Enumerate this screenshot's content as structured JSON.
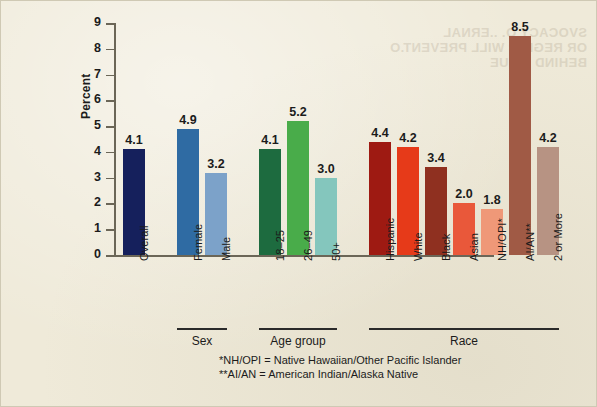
{
  "background_bleed_text": [
    "SVOCACY O. ..ERNAL",
    "OR REGIS = WILL PREVENT.O",
    "BEHIND ISSUE"
  ],
  "chart_data": {
    "type": "bar",
    "title": "",
    "xlabel": "",
    "ylabel": "Percent",
    "ylim": [
      0,
      9
    ],
    "yticks": [
      0,
      1,
      2,
      3,
      4,
      5,
      6,
      7,
      8,
      9
    ],
    "ytick_labels": [
      "0",
      "1",
      "2",
      "3",
      "4",
      "5",
      "6",
      "7",
      "8",
      "9"
    ],
    "grid": false,
    "legend": "none",
    "categories": [
      "Overall",
      "Female",
      "Male",
      "18–25",
      "26–49",
      "50+",
      "Hispanic",
      "White",
      "Black",
      "Asian",
      "NH/OPI*",
      "AI/AN**",
      "2 or More"
    ],
    "values": [
      4.1,
      4.9,
      3.2,
      4.1,
      5.2,
      3.0,
      4.4,
      4.2,
      3.4,
      2.0,
      1.8,
      8.5,
      4.2
    ],
    "value_labels": [
      "4.1",
      "4.9",
      "3.2",
      "4.1",
      "5.2",
      "3.0",
      "4.4",
      "4.2",
      "3.4",
      "2.0",
      "1.8",
      "8.5",
      "4.2"
    ],
    "colors": [
      "#15205c",
      "#2f6ba3",
      "#7ca2c9",
      "#1d6b3f",
      "#49ac4a",
      "#84c6bd",
      "#9e1a12",
      "#e63a19",
      "#8f3020",
      "#e9583a",
      "#ef9878",
      "#a05a45",
      "#b79383"
    ],
    "groups": [
      {
        "label": "Sex",
        "start_index": 1,
        "end_index": 2
      },
      {
        "label": "Age group",
        "start_index": 3,
        "end_index": 5
      },
      {
        "label": "Race",
        "start_index": 6,
        "end_index": 12
      }
    ],
    "footnotes": [
      "*NH/OPI = Native Hawaiian/Other Pacific Islander",
      "**AI/AN = American Indian/Alaska Native"
    ]
  }
}
